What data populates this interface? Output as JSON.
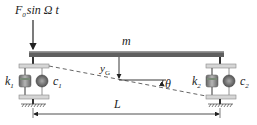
{
  "diagram": {
    "force": {
      "symbol": "F",
      "subscript": "0",
      "expr": "sin Ω t"
    },
    "beam": {
      "mass_label": "m"
    },
    "supports": [
      {
        "spring_symbol": "k",
        "spring_sub": "1",
        "damper_symbol": "c",
        "damper_sub": "1"
      },
      {
        "spring_symbol": "k",
        "spring_sub": "2",
        "damper_symbol": "c",
        "damper_sub": "2"
      }
    ],
    "displacement": {
      "symbol": "y",
      "subscript": "G"
    },
    "rotation": {
      "symbol": "θ"
    },
    "length": {
      "symbol": "L"
    },
    "colors": {
      "beam": "#5f5f5f",
      "beam_highlight": "#9a9a9a",
      "plate": "#d6d6d6",
      "spring": "#8a8a8a",
      "line": "#222222"
    }
  }
}
